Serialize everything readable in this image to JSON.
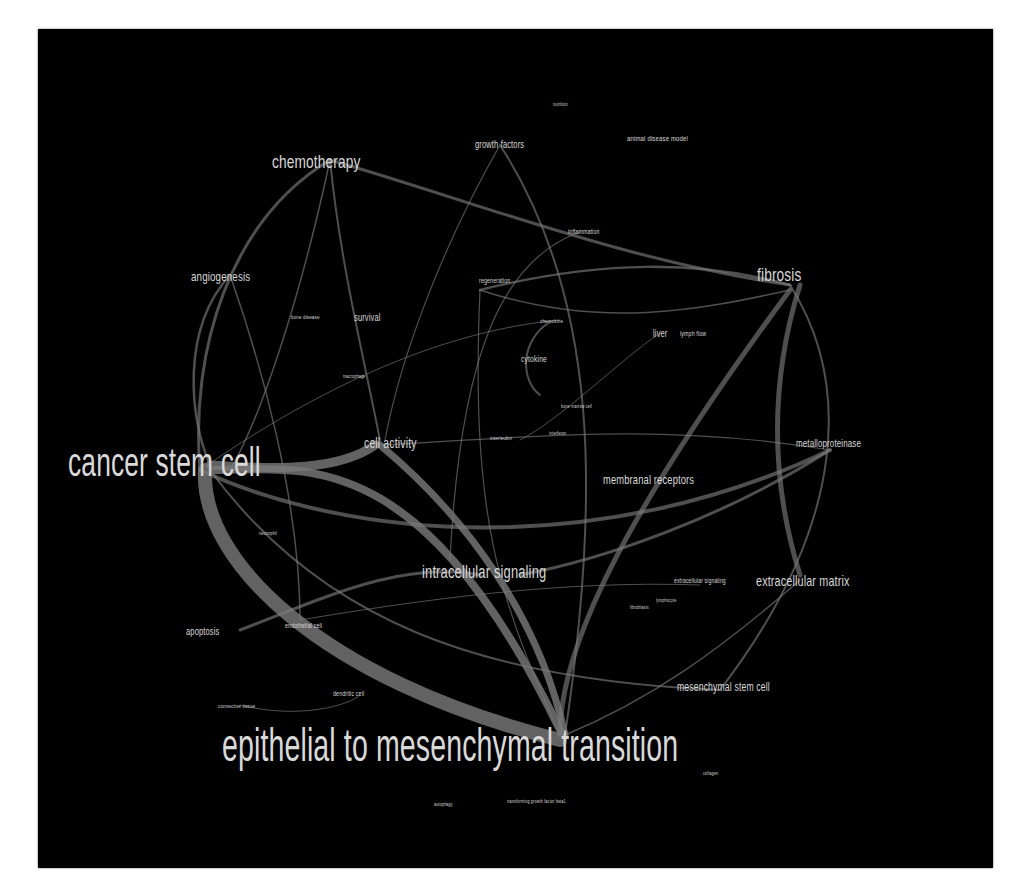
{
  "diagram": {
    "type": "keyword co-occurrence network",
    "background": "#000000",
    "edge_color": "#7a7a7a",
    "label_color": "#d9d9d9",
    "nodes": [
      {
        "id": "emt",
        "label": "epithelial to mesenchymal transition",
        "x": 222,
        "y": 722,
        "size": 46,
        "sx": 0.62
      },
      {
        "id": "csc",
        "label": "cancer stem cell",
        "x": 68,
        "y": 442,
        "size": 40,
        "sx": 0.66
      },
      {
        "id": "chemo",
        "label": "chemotherapy",
        "x": 272,
        "y": 152,
        "size": 19,
        "sx": 0.72
      },
      {
        "id": "fibrosis",
        "label": "fibrosis",
        "x": 757,
        "y": 265,
        "size": 19,
        "sx": 0.72
      },
      {
        "id": "ics",
        "label": "intracellular signaling",
        "x": 422,
        "y": 563,
        "size": 18,
        "sx": 0.72
      },
      {
        "id": "ecm",
        "label": "extracellular matrix",
        "x": 756,
        "y": 573,
        "size": 15,
        "sx": 0.72
      },
      {
        "id": "cellact",
        "label": "cell activity",
        "x": 364,
        "y": 435,
        "size": 15,
        "sx": 0.7
      },
      {
        "id": "angio",
        "label": "angiogenesis",
        "x": 191,
        "y": 270,
        "size": 13,
        "sx": 0.75
      },
      {
        "id": "memrec",
        "label": "membranal receptors",
        "x": 603,
        "y": 473,
        "size": 13,
        "sx": 0.72
      },
      {
        "id": "msc",
        "label": "mesenchymal stem cell",
        "x": 677,
        "y": 681,
        "size": 12,
        "sx": 0.72
      },
      {
        "id": "mmp",
        "label": "metalloproteinase",
        "x": 796,
        "y": 438,
        "size": 11,
        "sx": 0.72
      },
      {
        "id": "apop",
        "label": "apoptosis",
        "x": 186,
        "y": 627,
        "size": 10,
        "sx": 0.75
      },
      {
        "id": "gf",
        "label": "growth factors",
        "x": 475,
        "y": 140,
        "size": 10,
        "sx": 0.75
      },
      {
        "id": "adm",
        "label": "animal disease model",
        "x": 627,
        "y": 135,
        "size": 8,
        "sx": 0.75
      },
      {
        "id": "survival",
        "label": "survival",
        "x": 354,
        "y": 313,
        "size": 10,
        "sx": 0.75
      },
      {
        "id": "liver",
        "label": "liver",
        "x": 653,
        "y": 329,
        "size": 10,
        "sx": 0.75
      },
      {
        "id": "cytokine",
        "label": "cytokine",
        "x": 521,
        "y": 355,
        "size": 9,
        "sx": 0.75
      },
      {
        "id": "lymph",
        "label": "lymph flow",
        "x": 680,
        "y": 330,
        "size": 7,
        "sx": 0.75
      },
      {
        "id": "inflam",
        "label": "inflammation",
        "x": 568,
        "y": 228,
        "size": 7,
        "sx": 0.75
      },
      {
        "id": "regen",
        "label": "regeneration",
        "x": 479,
        "y": 277,
        "size": 7,
        "sx": 0.75
      },
      {
        "id": "chemok",
        "label": "chemokine",
        "x": 540,
        "y": 318,
        "size": 6,
        "sx": 0.75
      },
      {
        "id": "bone",
        "label": "bone disease",
        "x": 291,
        "y": 314,
        "size": 6,
        "sx": 0.75
      },
      {
        "id": "macro",
        "label": "macrophage",
        "x": 343,
        "y": 374,
        "size": 5,
        "sx": 0.75
      },
      {
        "id": "bmc",
        "label": "bone marrow cell",
        "x": 561,
        "y": 404,
        "size": 5,
        "sx": 0.75
      },
      {
        "id": "il",
        "label": "interleukin",
        "x": 490,
        "y": 435,
        "size": 6,
        "sx": 0.75
      },
      {
        "id": "ifn",
        "label": "interferon",
        "x": 549,
        "y": 431,
        "size": 5,
        "sx": 0.75
      },
      {
        "id": "ecs",
        "label": "extracellular signaling",
        "x": 674,
        "y": 577,
        "size": 7,
        "sx": 0.72
      },
      {
        "id": "lympho",
        "label": "lymphocyte",
        "x": 656,
        "y": 598,
        "size": 5,
        "sx": 0.75
      },
      {
        "id": "fibro",
        "label": "fibroblasts",
        "x": 630,
        "y": 605,
        "size": 5,
        "sx": 0.75
      },
      {
        "id": "neutro",
        "label": "neutrophil",
        "x": 259,
        "y": 531,
        "size": 5,
        "sx": 0.75
      },
      {
        "id": "endo",
        "label": "endothelial cell",
        "x": 285,
        "y": 622,
        "size": 7,
        "sx": 0.75
      },
      {
        "id": "dend",
        "label": "dendritic cell",
        "x": 333,
        "y": 690,
        "size": 7,
        "sx": 0.75
      },
      {
        "id": "conn",
        "label": "connective tissue",
        "x": 218,
        "y": 703,
        "size": 6,
        "sx": 0.75
      },
      {
        "id": "nutri",
        "label": "nutrition",
        "x": 553,
        "y": 102,
        "size": 5,
        "sx": 0.75
      },
      {
        "id": "collagen",
        "label": "collagen",
        "x": 703,
        "y": 771,
        "size": 5,
        "sx": 0.75
      },
      {
        "id": "autophagy",
        "label": "autophagy",
        "x": 434,
        "y": 802,
        "size": 5,
        "sx": 0.75
      },
      {
        "id": "tgfb",
        "label": "transforming growth factor beta1",
        "x": 507,
        "y": 799,
        "size": 5,
        "sx": 0.75
      }
    ],
    "edges": [
      {
        "d": "M205,470 C200,560 320,680 560,740",
        "w": 14
      },
      {
        "d": "M215,470 C300,470 420,440 560,730",
        "w": 8
      },
      {
        "d": "M210,465 C280,470 340,470 375,445",
        "w": 9
      },
      {
        "d": "M200,470 C350,540 600,560 830,450",
        "w": 4
      },
      {
        "d": "M380,445 C470,520 540,620 565,735",
        "w": 7
      },
      {
        "d": "M560,735 C560,650 620,520 790,290",
        "w": 5
      },
      {
        "d": "M800,285 C770,380 770,480 800,575",
        "w": 5
      },
      {
        "d": "M330,160 C230,220 190,350 200,470",
        "w": 3
      },
      {
        "d": "M330,160 C470,200 620,260 790,285",
        "w": 3
      },
      {
        "d": "M330,160 C340,260 360,340 380,440",
        "w": 2
      },
      {
        "d": "M330,160 C300,300 260,420 230,470",
        "w": 1.5
      },
      {
        "d": "M230,275 C180,330 190,420 210,465",
        "w": 2.5
      },
      {
        "d": "M230,275 C260,360 300,500 300,620",
        "w": 1.5
      },
      {
        "d": "M500,145 C600,300 600,500 565,735",
        "w": 2
      },
      {
        "d": "M500,145 C440,250 400,360 385,440",
        "w": 1.2
      },
      {
        "d": "M790,285 C850,380 850,520 720,690",
        "w": 2
      },
      {
        "d": "M210,470 C320,620 480,680 720,690",
        "w": 2
      },
      {
        "d": "M830,450 C720,520 600,560 520,575",
        "w": 3
      },
      {
        "d": "M240,630 C320,600 400,560 480,575",
        "w": 3
      },
      {
        "d": "M480,290 C600,260 700,260 790,285",
        "w": 2.5
      },
      {
        "d": "M480,290 C600,330 700,310 790,290",
        "w": 1.5
      },
      {
        "d": "M580,232 C500,260 460,360 450,560",
        "w": 1.2
      },
      {
        "d": "M550,322 C520,340 520,380 540,395",
        "w": 2
      },
      {
        "d": "M560,735 C500,600 470,520 480,290",
        "w": 1.2
      },
      {
        "d": "M300,620 C420,600 560,580 700,585",
        "w": 1
      },
      {
        "d": "M240,705 C300,720 350,705 360,695",
        "w": 1
      },
      {
        "d": "M565,735 C650,700 720,650 800,580",
        "w": 1.5
      },
      {
        "d": "M380,445 C500,440 650,420 830,450",
        "w": 1.2
      },
      {
        "d": "M660,333 C620,360 560,420 520,440",
        "w": 1
      },
      {
        "d": "M200,470 C330,380 450,330 560,320",
        "w": 1
      }
    ]
  }
}
